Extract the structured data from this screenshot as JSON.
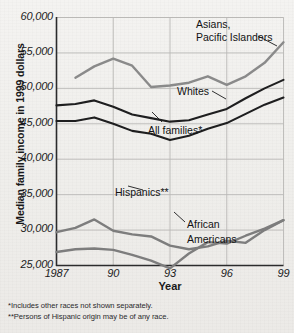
{
  "chart_data": {
    "type": "line",
    "title": "",
    "xlabel": "Year",
    "ylabel": "Median family income in 1999 dollars",
    "xlim": [
      1987,
      1999
    ],
    "ylim": [
      25000,
      60000
    ],
    "grid": true,
    "legend": "inline-annotations",
    "x": [
      1987,
      1988,
      1989,
      1990,
      1991,
      1992,
      1993,
      1994,
      1995,
      1996,
      1997,
      1998,
      1999
    ],
    "y_ticks": [
      25000,
      30000,
      35000,
      40000,
      45000,
      50000,
      55000,
      60000
    ],
    "y_tick_labels": [
      "25,000",
      "30,000",
      "35,000",
      "40,000",
      "45,000",
      "50,000",
      "55,000",
      "60,000"
    ],
    "x_ticks": [
      1987,
      1990,
      1993,
      1996,
      1999
    ],
    "x_tick_labels": [
      "1987",
      "90",
      "93",
      "96",
      "99"
    ],
    "series": [
      {
        "name": "Asians, Pacific Islanders",
        "color": "#8a8a8a",
        "x": [
          1988,
          1989,
          1990,
          1991,
          1992,
          1993,
          1994,
          1995,
          1996,
          1997,
          1998,
          1999
        ],
        "values": [
          51500,
          53100,
          54200,
          53200,
          50200,
          50400,
          50800,
          51700,
          50500,
          51700,
          53600,
          56500
        ]
      },
      {
        "name": "Whites",
        "color": "#1e1e1f",
        "x": [
          1987,
          1988,
          1989,
          1990,
          1991,
          1992,
          1993,
          1994,
          1995,
          1996,
          1997,
          1998,
          1999
        ],
        "values": [
          47600,
          47800,
          48300,
          47400,
          46300,
          45800,
          45300,
          45500,
          46300,
          47100,
          48600,
          50000,
          51200
        ]
      },
      {
        "name": "All families*",
        "color": "#1e1e1f",
        "x": [
          1987,
          1988,
          1989,
          1990,
          1991,
          1992,
          1993,
          1994,
          1995,
          1996,
          1997,
          1998,
          1999
        ],
        "values": [
          45400,
          45400,
          45900,
          45000,
          44000,
          43600,
          42700,
          43300,
          44300,
          45100,
          46400,
          47700,
          48700
        ]
      },
      {
        "name": "Hispanics**",
        "color": "#7d7d7d",
        "x": [
          1987,
          1988,
          1989,
          1990,
          1991,
          1992,
          1993,
          1994,
          1995,
          1996,
          1997,
          1998,
          1999
        ],
        "values": [
          29700,
          30300,
          31500,
          29900,
          29400,
          29100,
          27800,
          27300,
          27700,
          28500,
          28200,
          30000,
          31400
        ]
      },
      {
        "name": "African Americans",
        "color": "#7d7d7d",
        "x": [
          1987,
          1988,
          1989,
          1990,
          1991,
          1992,
          1993,
          1994,
          1995,
          1996,
          1997,
          1998,
          1999
        ],
        "values": [
          26900,
          27300,
          27400,
          27200,
          26500,
          25700,
          24600,
          26700,
          28300,
          28100,
          29200,
          30200,
          31400
        ]
      }
    ],
    "annotations": [
      {
        "text": "Asians,",
        "series": "Asians, Pacific Islanders"
      },
      {
        "text": "Pacific Islanders",
        "series": "Asians, Pacific Islanders"
      },
      {
        "text": "Whites",
        "series": "Whites"
      },
      {
        "text": "All families*",
        "series": "All families*"
      },
      {
        "text": "Hispanics**",
        "series": "Hispanics**"
      },
      {
        "text": "African",
        "series": "African Americans"
      },
      {
        "text": "Americans",
        "series": "African Americans"
      }
    ]
  },
  "labels": {
    "asians_line1": "Asians,",
    "asians_line2": "Pacific Islanders",
    "whites": "Whites",
    "all_families": "All families*",
    "hispanics": "Hispanics**",
    "african_line1": "African",
    "african_line2": "Americans",
    "y_axis_title": "Median family income in 1999 dollars",
    "x_axis_title": "Year"
  },
  "ytick_labels": [
    "60,000",
    "55,000",
    "50,000",
    "45,000",
    "40,000",
    "35,000",
    "30,000",
    "25,000"
  ],
  "xtick_labels": [
    "1987",
    "90",
    "93",
    "96",
    "99"
  ],
  "footnotes": [
    "*Includes other races not shown separately.",
    "**Persons of Hispanic origin may be of any race."
  ],
  "colors": {
    "dark_series": "#1e1e1f",
    "gray_series": "#858585",
    "axis": "#2b2b2c",
    "grid": "#b9b8b6",
    "background": "#f2f1ef"
  }
}
